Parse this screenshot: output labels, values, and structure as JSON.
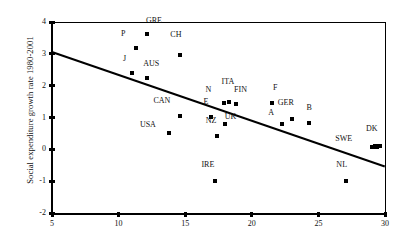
{
  "chart_data": {
    "type": "scatter",
    "title": "",
    "xlabel": "",
    "ylabel": "Social expenditure growth rate 1980-2001",
    "xlim": [
      5,
      30
    ],
    "ylim": [
      -2,
      4
    ],
    "xticks": [
      5,
      10,
      15,
      20,
      25,
      30
    ],
    "yticks": [
      4,
      3,
      2,
      1,
      0,
      -1,
      -2
    ],
    "grid": false,
    "legend": "none",
    "points": [
      {
        "label": "GRE",
        "x": 12.1,
        "y": 3.62,
        "lx": 0.55,
        "ly": 0.3
      },
      {
        "label": "P",
        "x": 11.3,
        "y": 3.17,
        "lx": -0.95,
        "ly": 0.32
      },
      {
        "label": "CH",
        "x": 14.6,
        "y": 2.95,
        "lx": -0.3,
        "ly": 0.52
      },
      {
        "label": "J",
        "x": 11.0,
        "y": 2.4,
        "lx": -0.55,
        "ly": 0.3
      },
      {
        "label": "AUS",
        "x": 12.1,
        "y": 2.25,
        "lx": 0.35,
        "ly": 0.32
      },
      {
        "label": "ITA",
        "x": 18.3,
        "y": 1.48,
        "lx": -0.1,
        "ly": 0.52
      },
      {
        "label": "N",
        "x": 17.9,
        "y": 1.45,
        "lx": -1.15,
        "ly": 0.3
      },
      {
        "label": "FIN",
        "x": 18.8,
        "y": 1.42,
        "lx": 0.35,
        "ly": 0.32
      },
      {
        "label": "F",
        "x": 21.5,
        "y": 1.45,
        "lx": 0.25,
        "ly": 0.35
      },
      {
        "label": "CAN",
        "x": 14.6,
        "y": 1.05,
        "lx": -1.35,
        "ly": 0.35
      },
      {
        "label": "E",
        "x": 16.9,
        "y": 1.02,
        "lx": -0.35,
        "ly": 0.35
      },
      {
        "label": "GER",
        "x": 23.0,
        "y": 0.95,
        "lx": -0.45,
        "ly": 0.38
      },
      {
        "label": "B",
        "x": 24.3,
        "y": 0.82,
        "lx": 0.0,
        "ly": 0.35
      },
      {
        "label": "A",
        "x": 22.3,
        "y": 0.8,
        "lx": -0.85,
        "ly": 0.22
      },
      {
        "label": "UK",
        "x": 18.0,
        "y": 0.8,
        "lx": 0.4,
        "ly": 0.08
      },
      {
        "label": "USA",
        "x": 13.8,
        "y": 0.5,
        "lx": -1.6,
        "ly": 0.14
      },
      {
        "label": "NZ",
        "x": 17.4,
        "y": 0.42,
        "lx": -0.45,
        "ly": 0.35
      },
      {
        "label": "SWE",
        "x": 29.2,
        "y": 0.08,
        "lx": -2.3,
        "ly": 0.12
      },
      {
        "label": "DK",
        "x": 29.4,
        "y": 0.1,
        "lx": -0.4,
        "ly": 0.4
      },
      {
        "label": "IRE",
        "x": 17.2,
        "y": -1.0,
        "lx": -0.5,
        "ly": 0.38
      },
      {
        "label": "NL",
        "x": 27.1,
        "y": -1.0,
        "lx": -0.35,
        "ly": 0.38
      }
    ],
    "trendline": {
      "x0": 5,
      "y0": 3.05,
      "x1": 30,
      "y1": -0.55
    }
  }
}
